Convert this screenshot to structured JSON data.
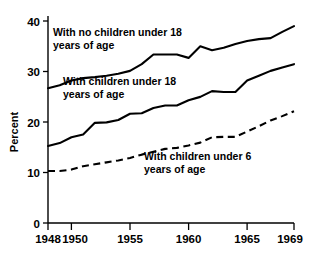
{
  "chart_data": {
    "type": "line",
    "title": "",
    "xlabel": "",
    "ylabel": "Percent",
    "xlim": [
      1948,
      1969
    ],
    "ylim": [
      0,
      43
    ],
    "grid": false,
    "legend_position": "inline-annotations",
    "x_ticks": [
      1948,
      1950,
      1955,
      1960,
      1965,
      1969
    ],
    "x_tick_labels": [
      "1948",
      "1950",
      "1955",
      "1960",
      "1965",
      "1969"
    ],
    "y_ticks": [
      0,
      10,
      20,
      30,
      40
    ],
    "y_tick_labels": [
      "0",
      "10",
      "20",
      "30",
      "40"
    ],
    "x": [
      1948,
      1949,
      1950,
      1951,
      1952,
      1953,
      1954,
      1955,
      1956,
      1957,
      1958,
      1959,
      1960,
      1961,
      1962,
      1963,
      1964,
      1965,
      1966,
      1967,
      1968,
      1969
    ],
    "series": [
      {
        "name": "With no children under 18 years of age",
        "style": "solid",
        "color": "#000000",
        "values": [
          28.0,
          28.6,
          29.6,
          30.1,
          30.3,
          30.6,
          31.0,
          31.6,
          33.0,
          35.0,
          35.0,
          35.0,
          34.3,
          36.7,
          35.9,
          36.4,
          37.2,
          37.8,
          38.2,
          38.4,
          39.7,
          40.9
        ]
      },
      {
        "name": "With children under 18 years of age",
        "style": "solid",
        "color": "#000000",
        "values": [
          16.0,
          16.6,
          17.8,
          18.4,
          20.8,
          20.9,
          21.4,
          22.7,
          22.8,
          23.9,
          24.4,
          24.4,
          25.5,
          26.2,
          27.4,
          27.2,
          27.2,
          29.6,
          30.6,
          31.6,
          32.3,
          33.0
        ]
      },
      {
        "name": "With children under 6 years of age",
        "style": "dashed",
        "color": "#000000",
        "values": [
          10.8,
          10.8,
          11.1,
          11.8,
          12.2,
          12.6,
          13.0,
          13.5,
          14.2,
          14.8,
          15.4,
          15.6,
          16.1,
          16.7,
          17.8,
          17.9,
          17.9,
          19.0,
          20.1,
          21.3,
          22.2,
          23.2
        ]
      }
    ],
    "annotations": [
      {
        "id": "label-no-children-18",
        "line1": "With no children under 18",
        "line2": "years of age"
      },
      {
        "id": "label-children-18",
        "line1": "With children under 18",
        "line2": "years of age"
      },
      {
        "id": "label-children-6",
        "line1": "With children under 6",
        "line2": "years of age"
      }
    ]
  }
}
